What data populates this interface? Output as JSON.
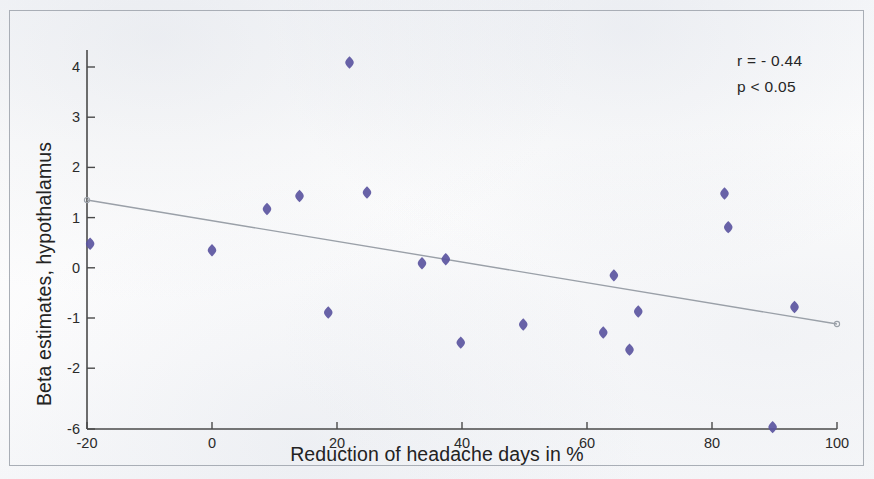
{
  "figure": {
    "kind": "scatter-plot-with-regression-line",
    "background_color": "#fbfbfc",
    "frame_color": "#a9aeb6",
    "marker_color": "#5b55a0",
    "marker_shape": "diamond",
    "trend_line_color": "#9aa0a8",
    "axis_color": "#4a4a4a"
  },
  "annotations": {
    "correlation": "r = - 0.44",
    "p_value": "p < 0.05"
  },
  "chart_data": {
    "type": "scatter",
    "title": "",
    "xlabel": "Reduction of headache days in %",
    "ylabel": "Beta estimates, hypothalamus",
    "xlim": [
      -20,
      100
    ],
    "ylim": [
      -6,
      4.6
    ],
    "xticks": [
      -20,
      0,
      20,
      40,
      60,
      80,
      100
    ],
    "xticklabels": [
      "-20",
      "0",
      "20",
      "40",
      "60",
      "80",
      "100"
    ],
    "yticks": [
      4,
      3,
      2,
      1,
      0,
      -1,
      -2,
      -6
    ],
    "yticklabels": [
      "4",
      "3",
      "2",
      "1",
      "0",
      "-1",
      "-2",
      "-6"
    ],
    "y_axis_broken_between": [
      -2,
      -6
    ],
    "grid": false,
    "legend": null,
    "points": [
      {
        "x": -19.5,
        "y": 0.48
      },
      {
        "x": 0.0,
        "y": 0.35
      },
      {
        "x": 8.8,
        "y": 1.17
      },
      {
        "x": 14.0,
        "y": 1.43
      },
      {
        "x": 18.6,
        "y": -0.89
      },
      {
        "x": 22.0,
        "y": 4.09
      },
      {
        "x": 24.8,
        "y": 1.5
      },
      {
        "x": 33.6,
        "y": 0.09
      },
      {
        "x": 37.4,
        "y": 0.17
      },
      {
        "x": 39.8,
        "y": -1.49
      },
      {
        "x": 49.8,
        "y": -1.13
      },
      {
        "x": 62.6,
        "y": -1.29
      },
      {
        "x": 64.3,
        "y": -0.15
      },
      {
        "x": 66.8,
        "y": -1.63
      },
      {
        "x": 68.2,
        "y": -0.87
      },
      {
        "x": 82.0,
        "y": 1.48
      },
      {
        "x": 82.6,
        "y": 0.81
      },
      {
        "x": 89.7,
        "y": -5.85
      },
      {
        "x": 93.2,
        "y": -0.78
      }
    ],
    "trend_line": {
      "x_start": -20,
      "y_start": 1.35,
      "x_end": 100,
      "y_end": -1.12,
      "endpoint_marker": "open-circle"
    }
  }
}
